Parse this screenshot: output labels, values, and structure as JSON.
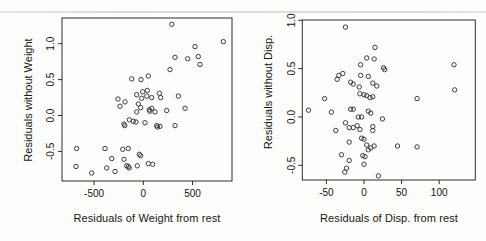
{
  "figure": {
    "background": "#fdfdfb",
    "axis_color": "#2b2b2b",
    "point_color": "#3d3d3d",
    "text_color": "#141414",
    "scan_line_color": "#d9d9d5"
  },
  "chart_data": [
    {
      "id": "weight",
      "type": "scatter",
      "marker": "open-circle",
      "grid": false,
      "xlabel": "Residuals of Weight from rest",
      "ylabel": "Residuals without Weight",
      "xlim": [
        -826,
        901
      ],
      "ylim": [
        -0.912,
        1.358
      ],
      "xticks": [
        {
          "v": -500,
          "label": "-500"
        },
        {
          "v": 0,
          "label": "0"
        },
        {
          "v": 500,
          "label": "500"
        }
      ],
      "yticks": [
        {
          "v": -0.5,
          "label": "-0.5"
        },
        {
          "v": 0.0,
          "label": "0.0"
        },
        {
          "v": 0.5,
          "label": "0.5"
        },
        {
          "v": 1.0,
          "label": "1.0"
        }
      ],
      "points": [
        [
          289,
          1.27
        ],
        [
          813,
          1.03
        ],
        [
          525,
          0.96
        ],
        [
          322,
          0.81
        ],
        [
          451,
          0.79
        ],
        [
          559,
          0.82
        ],
        [
          576,
          0.71
        ],
        [
          271,
          0.64
        ],
        [
          -118,
          0.51
        ],
        [
          -23,
          0.5
        ],
        [
          51,
          0.55
        ],
        [
          -67,
          0.29
        ],
        [
          -6,
          0.33
        ],
        [
          41,
          0.35
        ],
        [
          35,
          0.27
        ],
        [
          -16,
          0.24
        ],
        [
          85,
          0.25
        ],
        [
          163,
          0.31
        ],
        [
          177,
          0.25
        ],
        [
          356,
          0.27
        ],
        [
          -51,
          0.16
        ],
        [
          424,
          0.1
        ],
        [
          -257,
          0.23
        ],
        [
          -237,
          0.13
        ],
        [
          -186,
          0.19
        ],
        [
          -26,
          0.11
        ],
        [
          61,
          0.08
        ],
        [
          66,
          0.06
        ],
        [
          85,
          0.1
        ],
        [
          -67,
          0.05
        ],
        [
          119,
          0.05
        ],
        [
          238,
          0.07
        ],
        [
          -196,
          -0.12
        ],
        [
          -188,
          -0.14
        ],
        [
          -142,
          -0.06
        ],
        [
          -102,
          -0.08
        ],
        [
          -74,
          -0.09
        ],
        [
          17,
          -0.1
        ],
        [
          136,
          -0.14
        ],
        [
          143,
          -0.16
        ],
        [
          170,
          -0.15
        ],
        [
          322,
          -0.14
        ],
        [
          -677,
          -0.46
        ],
        [
          -389,
          -0.46
        ],
        [
          -321,
          -0.6
        ],
        [
          -684,
          -0.71
        ],
        [
          -524,
          -0.8
        ],
        [
          -372,
          -0.73
        ],
        [
          -288,
          -0.78
        ],
        [
          -209,
          -0.47
        ],
        [
          -152,
          -0.46
        ],
        [
          -41,
          -0.54
        ],
        [
          -26,
          -0.56
        ],
        [
          -196,
          -0.61
        ],
        [
          -169,
          -0.7
        ],
        [
          -152,
          -0.71
        ],
        [
          -143,
          -0.73
        ],
        [
          -61,
          -0.7
        ],
        [
          51,
          -0.67
        ],
        [
          95,
          -0.68
        ]
      ]
    },
    {
      "id": "disp",
      "type": "scatter",
      "marker": "open-circle",
      "grid": false,
      "xlabel": "Residuals of Disp. from rest",
      "ylabel": "Residuals without Disp.",
      "xlim": [
        -82,
        148
      ],
      "ylim": [
        -0.652,
        1.003
      ],
      "xticks": [
        {
          "v": -50,
          "label": "-50"
        },
        {
          "v": 0,
          "label": "0"
        },
        {
          "v": 50,
          "label": "50"
        },
        {
          "v": 100,
          "label": "100"
        }
      ],
      "yticks": [
        {
          "v": -0.5,
          "label": "-0.5"
        },
        {
          "v": 0.0,
          "label": "0.0"
        },
        {
          "v": 0.5,
          "label": "0.5"
        },
        {
          "v": 1.0,
          "label": "1.0"
        }
      ],
      "points": [
        [
          -24.5,
          0.93
        ],
        [
          14.7,
          0.72
        ],
        [
          3.6,
          0.61
        ],
        [
          13.4,
          0.6
        ],
        [
          -4.5,
          0.54
        ],
        [
          25.9,
          0.51
        ],
        [
          27.5,
          0.49
        ],
        [
          119.7,
          0.54
        ],
        [
          -28.1,
          0.45
        ],
        [
          -35.8,
          0.39
        ],
        [
          -33.5,
          0.43
        ],
        [
          -4.4,
          0.43
        ],
        [
          5.8,
          0.42
        ],
        [
          -17.8,
          0.36
        ],
        [
          -14.3,
          0.34
        ],
        [
          11.7,
          0.35
        ],
        [
          -6.3,
          0.31
        ],
        [
          17,
          0.32
        ],
        [
          120.6,
          0.28
        ],
        [
          -5.4,
          0.24
        ],
        [
          0,
          0.23
        ],
        [
          3.6,
          0.22
        ],
        [
          8,
          0.2
        ],
        [
          11.7,
          0.21
        ],
        [
          -52.3,
          0.19
        ],
        [
          70.6,
          0.19
        ],
        [
          -73.7,
          0.07
        ],
        [
          -43.3,
          0.05
        ],
        [
          -17.8,
          0.08
        ],
        [
          -14.3,
          0.08
        ],
        [
          5.8,
          0.06
        ],
        [
          9,
          0.04
        ],
        [
          -7.6,
          0.0
        ],
        [
          -3.1,
          0.0
        ],
        [
          24.5,
          -0.02
        ],
        [
          -24.5,
          -0.06
        ],
        [
          -37.5,
          -0.14
        ],
        [
          -19.7,
          -0.11
        ],
        [
          -14.3,
          -0.11
        ],
        [
          -9,
          -0.09
        ],
        [
          -5.4,
          -0.13
        ],
        [
          11.7,
          -0.1
        ],
        [
          11.7,
          -0.14
        ],
        [
          -19.7,
          -0.26
        ],
        [
          -3.1,
          -0.22
        ],
        [
          0,
          -0.23
        ],
        [
          3.6,
          -0.29
        ],
        [
          9,
          -0.32
        ],
        [
          13.4,
          -0.3
        ],
        [
          44.6,
          -0.3
        ],
        [
          70.6,
          -0.31
        ],
        [
          -29.9,
          -0.39
        ],
        [
          -19.7,
          -0.45
        ],
        [
          -1.7,
          -0.4
        ],
        [
          1.3,
          -0.41
        ],
        [
          5.8,
          -0.34
        ],
        [
          -23.2,
          -0.53
        ],
        [
          0,
          -0.49
        ],
        [
          -25.5,
          -0.57
        ],
        [
          19.2,
          -0.61
        ]
      ]
    }
  ]
}
